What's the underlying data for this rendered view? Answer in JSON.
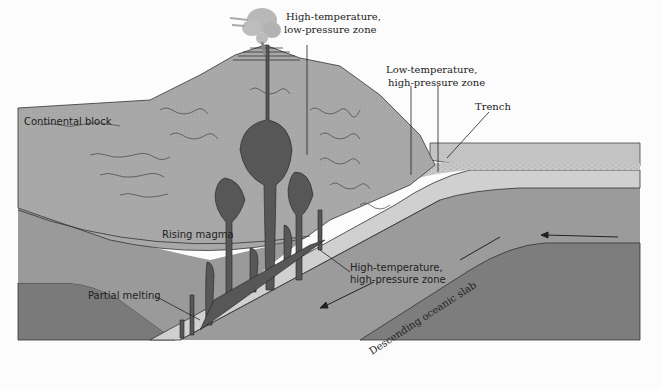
{
  "diagram": {
    "type": "cross-section",
    "labels": {
      "high_temp_low_pressure": [
        "High-temperature,",
        "low-pressure zone"
      ],
      "low_temp_high_pressure": [
        "Low-temperature,",
        "high-pressure zone"
      ],
      "trench": "Trench",
      "continental_block": "Continental block",
      "rising_magma": "Rising magma",
      "high_temp_high_pressure": [
        "High-temperature,",
        "high-pressure zone"
      ],
      "partial_melting": "Partial melting",
      "descending_slab": "Descending oceanic slab"
    },
    "arrows": [
      {
        "name": "plate-motion-arrow",
        "direction": "left"
      },
      {
        "name": "slab-motion-arrow",
        "direction": "down-left"
      },
      {
        "name": "mantle-flow-arrow",
        "direction": "down-left"
      }
    ],
    "colors": {
      "continent": "#a9a9a9",
      "magma": "#5a5a5a",
      "slab": "#cfcfcf",
      "mantle_upper": "#9a9a9a",
      "mantle_lower": "#7c7c7c",
      "ocean": "#c4c4c4",
      "plume": "#b8b8b8"
    }
  }
}
